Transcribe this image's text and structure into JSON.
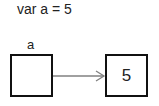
{
  "code_line": "var a = 5",
  "variable": {
    "name": "a"
  },
  "value": {
    "text": "5"
  },
  "arrow": {
    "color": "#808080"
  }
}
